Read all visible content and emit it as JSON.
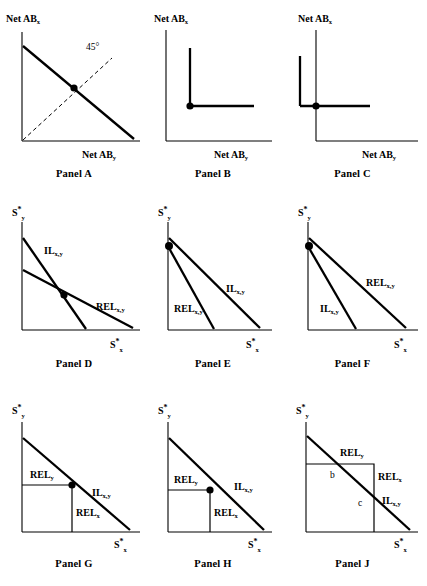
{
  "figure": {
    "background": "#ffffff",
    "ink": "#000000",
    "rows": 3,
    "cols": 3
  },
  "labels": {
    "net_ab_x": "Net AB",
    "net_ab_y": "Net AB",
    "sub_x": "x",
    "sub_y": "y",
    "sub_xy": "x,y",
    "star": "*",
    "s_letter": "S",
    "rel": "REL",
    "il": "IL",
    "angle_45": "45°",
    "point_b": "b",
    "point_c": "c"
  },
  "panels": [
    {
      "id": "A",
      "caption": "Panel A",
      "yaxis_label": "Net AB",
      "yaxis_sub": "x",
      "xaxis_label": "Net AB",
      "xaxis_sub": "y",
      "annotation": "45°",
      "description": "Downward sloping net arbitrage line from top of vertical axis to right end of horizontal axis, crossed by a dashed 45 degree ray from the origin; intersection marked with a dot."
    },
    {
      "id": "B",
      "caption": "Panel B",
      "yaxis_label": "Net AB",
      "yaxis_sub": "x",
      "xaxis_label": "Net AB",
      "xaxis_sub": "y",
      "description": "L-shaped kinked locus lying inside the axes, corner marked with a dot."
    },
    {
      "id": "C",
      "caption": "Panel C",
      "yaxis_label": "Net AB",
      "yaxis_sub": "x",
      "xaxis_label": "Net AB",
      "xaxis_sub": "y",
      "description": "L-shaped kinked locus whose corner dot sits on the vertical axis, with a short arm extending left of the axis."
    },
    {
      "id": "D",
      "caption": "Panel D",
      "yaxis_label": "S",
      "yaxis_sup": "*",
      "yaxis_sub": "y",
      "xaxis_label": "S",
      "xaxis_sup": "*",
      "xaxis_sub": "x",
      "curves": [
        {
          "name": "IL",
          "sub": "x,y"
        },
        {
          "name": "REL",
          "sub": "x,y"
        }
      ],
      "description": "Steep IL line and flatter REL line intersecting at an interior point marked with a dot."
    },
    {
      "id": "E",
      "caption": "Panel E",
      "yaxis_label": "S",
      "yaxis_sup": "*",
      "yaxis_sub": "y",
      "xaxis_label": "S",
      "xaxis_sup": "*",
      "xaxis_sub": "x",
      "curves": [
        {
          "name": "IL",
          "sub": "x,y"
        },
        {
          "name": "REL",
          "sub": "x,y"
        }
      ],
      "description": "IL is the outer flatter line; REL is the inner steeper line; both share a dotted origin point on the vertical axis."
    },
    {
      "id": "F",
      "caption": "Panel F",
      "yaxis_label": "S",
      "yaxis_sup": "*",
      "yaxis_sub": "y",
      "xaxis_label": "S",
      "xaxis_sup": "*",
      "xaxis_sub": "x",
      "curves": [
        {
          "name": "REL",
          "sub": "x,y"
        },
        {
          "name": "IL",
          "sub": "x,y"
        }
      ],
      "description": "REL is the outer flatter line; IL is the inner steeper line; both share a dotted origin point on the vertical axis."
    },
    {
      "id": "G",
      "caption": "Panel G",
      "yaxis_label": "S",
      "yaxis_sup": "*",
      "yaxis_sub": "y",
      "xaxis_label": "S",
      "xaxis_sup": "*",
      "xaxis_sub": "x",
      "curves": [
        {
          "name": "IL",
          "sub": "x,y"
        },
        {
          "name": "REL",
          "sub": "y"
        },
        {
          "name": "REL",
          "sub": "x"
        }
      ],
      "description": "Rectangle whose upper right corner lies exactly on the IL line, corner marked with a dot."
    },
    {
      "id": "H",
      "caption": "Panel H",
      "yaxis_label": "S",
      "yaxis_sup": "*",
      "yaxis_sub": "y",
      "xaxis_label": "S",
      "xaxis_sup": "*",
      "xaxis_sub": "x",
      "curves": [
        {
          "name": "IL",
          "sub": "x,y"
        },
        {
          "name": "REL",
          "sub": "y"
        },
        {
          "name": "REL",
          "sub": "x"
        }
      ],
      "description": "Rectangle whose upper right corner lies strictly inside the IL line, corner marked with a dot."
    },
    {
      "id": "J",
      "caption": "Panel J",
      "yaxis_label": "S",
      "yaxis_sup": "*",
      "yaxis_sub": "y",
      "xaxis_label": "S",
      "xaxis_sup": "*",
      "xaxis_sub": "x",
      "curves": [
        {
          "name": "IL",
          "sub": "x,y"
        },
        {
          "name": "REL",
          "sub": "y"
        },
        {
          "name": "REL",
          "sub": "x"
        }
      ],
      "points": [
        "b",
        "c"
      ],
      "description": "Large rectangle cut by the IL line, crossing the top edge at b and the right edge at c."
    }
  ]
}
